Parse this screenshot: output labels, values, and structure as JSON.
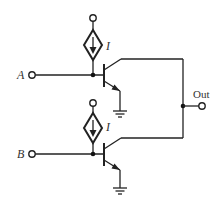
{
  "diagram": {
    "type": "circuit-schematic",
    "colors": {
      "line": "#222222",
      "background": "#ffffff"
    },
    "labels": {
      "input_a": "A",
      "input_b": "B",
      "output": "Out",
      "current_top": "I",
      "current_bottom": "I"
    },
    "components": [
      {
        "id": "current-source-top",
        "kind": "dependent-current-source",
        "label": "I",
        "direction": "down"
      },
      {
        "id": "current-source-bottom",
        "kind": "dependent-current-source",
        "label": "I",
        "direction": "down"
      },
      {
        "id": "transistor-top",
        "kind": "npn-bjt",
        "base": "A",
        "collector": "Out",
        "emitter": "ground"
      },
      {
        "id": "transistor-bottom",
        "kind": "npn-bjt",
        "base": "B",
        "collector": "Out",
        "emitter": "ground"
      }
    ]
  }
}
